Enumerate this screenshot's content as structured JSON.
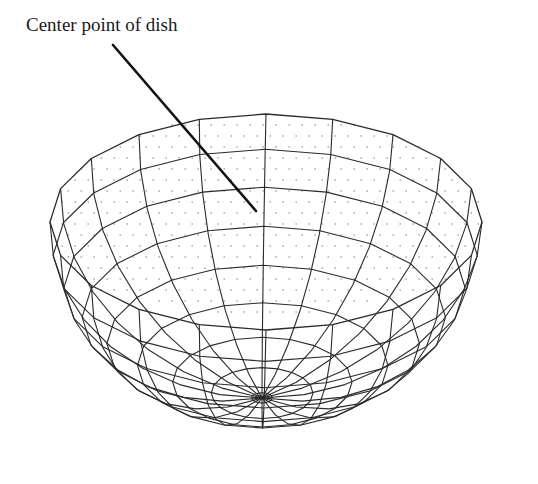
{
  "diagram": {
    "title": "Center point of dish",
    "colors": {
      "line": "#2a2a2a",
      "leader": "#111111",
      "dots": "#7a7a7a",
      "background": "#ffffff"
    },
    "label": {
      "text": "Center point of dish",
      "leader_from": [
        113,
        45
      ],
      "leader_to": [
        256,
        211
      ]
    },
    "dish": {
      "rim_center": [
        266,
        222
      ],
      "rim_rx": 216,
      "rim_ry": 108,
      "pole": [
        262,
        398
      ],
      "meridians": 20,
      "parallels": 8
    }
  }
}
